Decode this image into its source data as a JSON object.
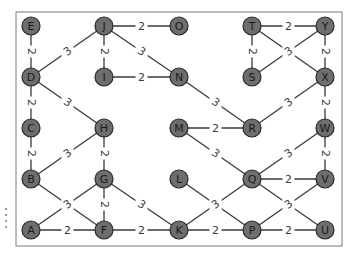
{
  "diagram": {
    "type": "weighted-undirected-graph",
    "frame": {
      "x": 16,
      "y": 12,
      "w": 326,
      "h": 234,
      "stroke": "#7a7a7a"
    },
    "node_style": {
      "radius": 9,
      "fill": "#6e6e6e",
      "stroke": "#2a2a2a",
      "label_color": "#1a1a1a"
    },
    "edge_color": "#3a3a3a",
    "nodes": [
      {
        "id": "E",
        "x": 31,
        "y": 26
      },
      {
        "id": "D",
        "x": 31,
        "y": 77
      },
      {
        "id": "C",
        "x": 31,
        "y": 128
      },
      {
        "id": "B",
        "x": 31,
        "y": 179
      },
      {
        "id": "A",
        "x": 31,
        "y": 230
      },
      {
        "id": "J",
        "x": 104,
        "y": 26
      },
      {
        "id": "I",
        "x": 104,
        "y": 77
      },
      {
        "id": "H",
        "x": 104,
        "y": 128
      },
      {
        "id": "G",
        "x": 104,
        "y": 179
      },
      {
        "id": "F",
        "x": 104,
        "y": 230
      },
      {
        "id": "O",
        "x": 179,
        "y": 26
      },
      {
        "id": "N",
        "x": 179,
        "y": 77
      },
      {
        "id": "M",
        "x": 179,
        "y": 128
      },
      {
        "id": "L",
        "x": 179,
        "y": 179
      },
      {
        "id": "K",
        "x": 179,
        "y": 230
      },
      {
        "id": "T",
        "x": 252,
        "y": 26
      },
      {
        "id": "S",
        "x": 252,
        "y": 77
      },
      {
        "id": "R",
        "x": 252,
        "y": 128
      },
      {
        "id": "Q",
        "x": 252,
        "y": 179
      },
      {
        "id": "P",
        "x": 252,
        "y": 230
      },
      {
        "id": "Y",
        "x": 325,
        "y": 26
      },
      {
        "id": "X",
        "x": 325,
        "y": 77
      },
      {
        "id": "W",
        "x": 325,
        "y": 128
      },
      {
        "id": "V",
        "x": 325,
        "y": 179
      },
      {
        "id": "U",
        "x": 325,
        "y": 230
      }
    ],
    "edges": [
      {
        "from": "E",
        "to": "D",
        "weight": "2"
      },
      {
        "from": "D",
        "to": "C",
        "weight": "2"
      },
      {
        "from": "C",
        "to": "B",
        "weight": "2"
      },
      {
        "from": "D",
        "to": "J",
        "weight": "3"
      },
      {
        "from": "D",
        "to": "H",
        "weight": "3"
      },
      {
        "from": "J",
        "to": "O",
        "weight": "2"
      },
      {
        "from": "J",
        "to": "I",
        "weight": "2"
      },
      {
        "from": "J",
        "to": "N",
        "weight": "3"
      },
      {
        "from": "I",
        "to": "N",
        "weight": "2"
      },
      {
        "from": "B",
        "to": "H",
        "weight": "3"
      },
      {
        "from": "H",
        "to": "G",
        "weight": "2"
      },
      {
        "from": "B",
        "to": "F",
        "weight": "3"
      },
      {
        "from": "A",
        "to": "G",
        "weight": "3"
      },
      {
        "from": "G",
        "to": "F",
        "weight": "2"
      },
      {
        "from": "G",
        "to": "K",
        "weight": "3"
      },
      {
        "from": "A",
        "to": "F",
        "weight": "2"
      },
      {
        "from": "F",
        "to": "K",
        "weight": "2"
      },
      {
        "from": "N",
        "to": "R",
        "weight": "3"
      },
      {
        "from": "M",
        "to": "R",
        "weight": "2"
      },
      {
        "from": "M",
        "to": "Q",
        "weight": "3"
      },
      {
        "from": "L",
        "to": "P",
        "weight": "3"
      },
      {
        "from": "K",
        "to": "Q",
        "weight": "3"
      },
      {
        "from": "K",
        "to": "P",
        "weight": "2"
      },
      {
        "from": "T",
        "to": "Y",
        "weight": "2"
      },
      {
        "from": "T",
        "to": "S",
        "weight": "2"
      },
      {
        "from": "T",
        "to": "X",
        "weight": "3"
      },
      {
        "from": "S",
        "to": "Y",
        "weight": "3"
      },
      {
        "from": "Y",
        "to": "X",
        "weight": "2"
      },
      {
        "from": "X",
        "to": "W",
        "weight": "2"
      },
      {
        "from": "R",
        "to": "X",
        "weight": "3"
      },
      {
        "from": "W",
        "to": "V",
        "weight": "2"
      },
      {
        "from": "Q",
        "to": "W",
        "weight": "3"
      },
      {
        "from": "Q",
        "to": "V",
        "weight": "2"
      },
      {
        "from": "Q",
        "to": "U",
        "weight": "3"
      },
      {
        "from": "P",
        "to": "V",
        "weight": "3"
      },
      {
        "from": "P",
        "to": "U",
        "weight": "2"
      }
    ]
  }
}
